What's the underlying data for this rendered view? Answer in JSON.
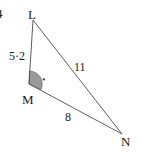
{
  "question_number": "4",
  "triangle": {
    "vertices": {
      "L": {
        "label": "L",
        "x": 33,
        "y": 20
      },
      "M": {
        "label": "M",
        "x": 29,
        "y": 84
      },
      "N": {
        "label": "N",
        "x": 122,
        "y": 134
      }
    },
    "sides": {
      "LM": {
        "label": "5·2"
      },
      "LN": {
        "label": "11"
      },
      "MN": {
        "label": "8"
      }
    },
    "marked_angle": {
      "vertex": "M",
      "marker": "⋆",
      "fill_color": "#9a9a9a"
    }
  },
  "colors": {
    "line": "#4a4a4a",
    "text": "#1a1a1a",
    "background": "#ffffff"
  }
}
